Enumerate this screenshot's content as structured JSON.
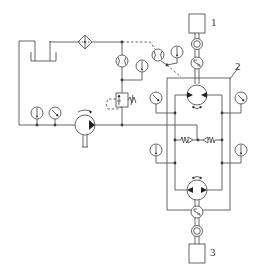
{
  "diagram": {
    "labels": {
      "label_1": "1",
      "label_2": "2",
      "label_3": "3"
    },
    "components": [
      {
        "id": "tank",
        "type": "reservoir"
      },
      {
        "id": "filter",
        "type": "filter"
      },
      {
        "id": "flow-meter-return",
        "type": "flow-meter"
      },
      {
        "id": "flow-meter-drain",
        "type": "flow-meter"
      },
      {
        "id": "thermometer-return",
        "type": "thermometer"
      },
      {
        "id": "thermometer-drain",
        "type": "thermometer"
      },
      {
        "id": "relief-valve",
        "type": "pressure-relief-valve"
      },
      {
        "id": "thermometer-supply",
        "type": "thermometer"
      },
      {
        "id": "pressure-gauge-supply",
        "type": "pressure-gauge"
      },
      {
        "id": "charge-pump",
        "type": "fixed-displacement-pump"
      },
      {
        "id": "unit-1",
        "type": "box",
        "label": "1"
      },
      {
        "id": "unit-3",
        "type": "box",
        "label": "3"
      },
      {
        "id": "test-assembly-2",
        "type": "enclosure",
        "label": "2"
      },
      {
        "id": "upper-pump-motor",
        "type": "bidirectional-pump-motor"
      },
      {
        "id": "lower-pump-motor",
        "type": "bidirectional-pump-motor"
      },
      {
        "id": "upper-torque-sensor",
        "type": "torque-speed-sensor"
      },
      {
        "id": "upper-coupling",
        "type": "coupling"
      },
      {
        "id": "lower-torque-sensor",
        "type": "torque-speed-sensor"
      },
      {
        "id": "lower-coupling",
        "type": "coupling"
      },
      {
        "id": "check-valve-left",
        "type": "spring-check-valve"
      },
      {
        "id": "check-valve-right",
        "type": "spring-check-valve"
      },
      {
        "id": "pressure-gauge-left",
        "type": "pressure-gauge"
      },
      {
        "id": "pressure-gauge-right",
        "type": "pressure-gauge"
      },
      {
        "id": "thermometer-left",
        "type": "thermometer"
      },
      {
        "id": "thermometer-right",
        "type": "thermometer"
      }
    ]
  }
}
